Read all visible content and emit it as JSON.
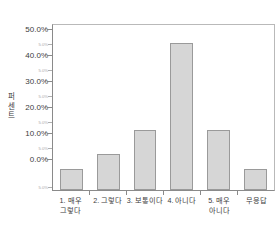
{
  "chart_data": {
    "type": "bar",
    "title": "",
    "subtitle": "",
    "xlabel": "",
    "ylabel": "퍼센트",
    "ylabel_chars": [
      "퍼",
      "센",
      "트"
    ],
    "categories": [
      "1. 매우 그렇다",
      "2. 그렇다",
      "3. 보통이다",
      "4. 아니다",
      "5. 매우 아니다",
      "무응답"
    ],
    "category_lines": [
      [
        "1. 매우",
        "그렇다"
      ],
      [
        "2. 그렇다",
        ""
      ],
      [
        "3. 보통이다",
        ""
      ],
      [
        "4. 아니다",
        ""
      ],
      [
        "5. 매우",
        "아니다"
      ],
      [
        "무응답",
        ""
      ]
    ],
    "values": [
      2.1,
      7.4,
      15.8,
      45.8,
      15.8,
      2.1
    ],
    "value_labels": [
      "2.1%",
      "7.4%",
      "15.8%",
      "45.8%",
      "15.8%",
      "2.1%"
    ],
    "ylim": [
      -5.0,
      52.0
    ],
    "y_major_ticks": [
      0.0,
      10.0,
      20.0,
      30.0,
      40.0,
      50.0
    ],
    "y_major_labels": [
      "0.0%",
      "10.0%",
      "20.0%",
      "30.0%",
      "40.0%",
      "50.0%"
    ],
    "y_minor_ticks": [
      -5.0,
      5.0,
      15.0,
      25.0,
      35.0,
      45.0
    ],
    "y_minor_labels": [
      "5.0%",
      "5.0%",
      "5.0%",
      "5.0%",
      "5.0%",
      "5.0%"
    ],
    "grid": false,
    "legend": null,
    "legend_position": "none",
    "bar_fill_color": "#d6d6d6",
    "bar_border_color": "#9a9a9a",
    "axis_color": "#8a8a8a",
    "plot_background": "#ffffff",
    "text_color": "#3c3c3c"
  }
}
